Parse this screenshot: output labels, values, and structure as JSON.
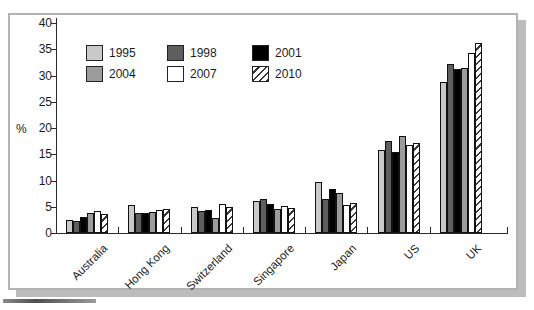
{
  "chart_data": {
    "type": "bar",
    "title": "",
    "xlabel": "",
    "ylabel": "%",
    "ylim": [
      0,
      40
    ],
    "yticks": [
      0,
      5,
      10,
      15,
      20,
      25,
      30,
      35,
      40
    ],
    "grid": false,
    "legend_position": "top-left-inside",
    "categories": [
      "Australia",
      "Hong Kong",
      "Switzerland",
      "Singapore",
      "Japan",
      "US",
      "UK"
    ],
    "series": [
      {
        "name": "1995",
        "color": "#c9c9c9",
        "pattern": "solid",
        "values": [
          2.5,
          5.4,
          5.0,
          6.0,
          9.7,
          15.8,
          28.8
        ]
      },
      {
        "name": "1998",
        "color": "#5e5e5e",
        "pattern": "solid",
        "values": [
          2.2,
          3.8,
          4.1,
          6.4,
          6.5,
          17.6,
          32.1
        ]
      },
      {
        "name": "2001",
        "color": "#000000",
        "pattern": "solid",
        "values": [
          3.1,
          3.8,
          4.3,
          5.6,
          8.4,
          15.4,
          31.2
        ]
      },
      {
        "name": "2004",
        "color": "#9b9b9b",
        "pattern": "solid",
        "values": [
          3.9,
          4.0,
          2.9,
          4.5,
          7.6,
          18.5,
          31.4
        ]
      },
      {
        "name": "2007",
        "color": "#ffffff",
        "pattern": "solid",
        "values": [
          4.2,
          4.3,
          5.5,
          5.1,
          5.3,
          16.8,
          34.2
        ]
      },
      {
        "name": "2010",
        "color": "#ffffff",
        "pattern": "diagonal-hatch",
        "values": [
          3.6,
          4.6,
          4.9,
          4.8,
          5.7,
          17.2,
          36.2
        ]
      }
    ]
  }
}
